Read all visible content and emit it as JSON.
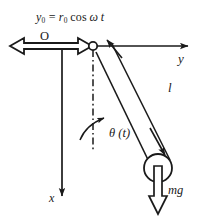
{
  "figure": {
    "background_color": "#ffffff",
    "stroke_color": "#1a1a1a",
    "labels": {
      "drive_equation": "y₀ = r₀ cos ω t",
      "drive_equation_parts": {
        "lhs_symbol": "y",
        "lhs_subscript": "0",
        "amplitude_symbol": "r",
        "amplitude_subscript": "0",
        "function": "cos",
        "angular_frequency": "ω",
        "time": "t"
      },
      "origin": "O",
      "axis_y": "y",
      "axis_x": "x",
      "rod_length": "l",
      "angle": "θ (t)",
      "weight": "mg"
    },
    "elements": {
      "pivot_marker": "open-circle",
      "bob_marker": "open-circle",
      "reference_line_style": "dash-dot",
      "drive_arrow_style": "hollow-double-headed-horizontal",
      "rod_arrow_style": "double-headed",
      "weight_arrow_style": "hollow-down",
      "angle_arc_style": "curved-arrow"
    },
    "geometry": {
      "pivot_x": 93,
      "pivot_y": 46,
      "bob_x": 158,
      "bob_y": 168,
      "bob_radius": 14,
      "y_axis_end_x": 196,
      "x_axis_end_y": 205,
      "angle_degrees": 28
    }
  }
}
